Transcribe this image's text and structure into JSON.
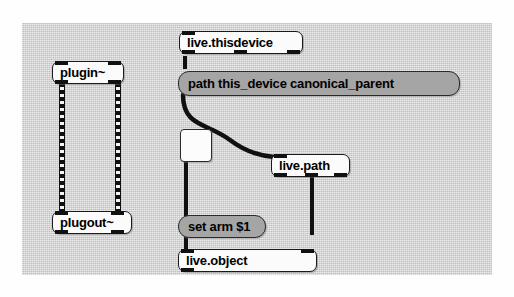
{
  "window": {
    "type": "max-msp-patcher",
    "canvas_background": "#d4d4d4",
    "page_background": "#fefefe"
  },
  "objects": [
    {
      "id": "plugin",
      "kind": "object-box",
      "label": "plugin~",
      "inlets": 2,
      "outlets": 2
    },
    {
      "id": "plugout",
      "kind": "object-box",
      "label": "plugout~",
      "inlets": 2,
      "outlets": 2
    },
    {
      "id": "live-thisdevice",
      "kind": "object-box",
      "label": "live.thisdevice",
      "inlets": 1,
      "outlets": 3
    },
    {
      "id": "path-message",
      "kind": "message-box",
      "label": "path this_device canonical_parent",
      "inlets": 1,
      "outlets": 1
    },
    {
      "id": "live-path",
      "kind": "object-box",
      "label": "live.path",
      "inlets": 1,
      "outlets": 3
    },
    {
      "id": "toggle",
      "kind": "toggle",
      "label": "",
      "inlets": 1,
      "outlets": 1
    },
    {
      "id": "set-arm-message",
      "kind": "message-box",
      "label": "set arm $1",
      "inlets": 1,
      "outlets": 1
    },
    {
      "id": "live-object",
      "kind": "object-box",
      "label": "live.object",
      "inlets": 2,
      "outlets": 1
    }
  ],
  "cables": [
    {
      "id": "plugin-left-to-plugout-left",
      "type": "signal",
      "from": "plugin",
      "to": "plugout"
    },
    {
      "id": "plugin-right-to-plugout-right",
      "type": "signal",
      "from": "plugin",
      "to": "plugout"
    },
    {
      "id": "thisdevice-to-path-message",
      "type": "control",
      "from": "live-thisdevice",
      "to": "path-message"
    },
    {
      "id": "path-message-to-live-path",
      "type": "control",
      "from": "path-message",
      "to": "live-path"
    },
    {
      "id": "live-path-to-live-object",
      "type": "control",
      "from": "live-path",
      "to": "live-object"
    },
    {
      "id": "toggle-to-set-arm",
      "type": "control",
      "from": "toggle",
      "to": "set-arm-message"
    },
    {
      "id": "set-arm-to-live-object",
      "type": "control",
      "from": "set-arm-message",
      "to": "live-object"
    }
  ],
  "colors": {
    "object_fill": "#fbfbfb",
    "message_fill": "#a5a5a5",
    "border": "#1a1a1a",
    "cable": "#101010",
    "text": "#000000"
  }
}
